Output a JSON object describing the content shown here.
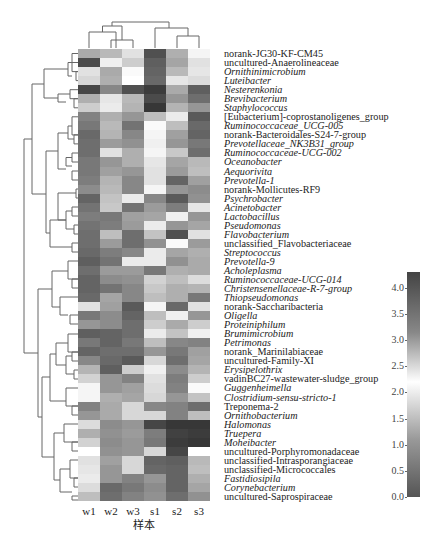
{
  "chart_data": {
    "type": "heatmap",
    "title": "",
    "xlabel": "样本",
    "ylabel": "",
    "columns": [
      "w1",
      "w2",
      "w3",
      "s1",
      "s2",
      "s3"
    ],
    "rows": [
      {
        "label": "norank-JG30-KF-CM45",
        "italic": false
      },
      {
        "label": "uncultured-Anaerolineaceae",
        "italic": false
      },
      {
        "label": "Ornithinimicrobium",
        "italic": true
      },
      {
        "label": "Luteibacter",
        "italic": true
      },
      {
        "label": "Nesterenkonia",
        "italic": true
      },
      {
        "label": "Brevibacterium",
        "italic": true
      },
      {
        "label": "Staphylococcus",
        "italic": true
      },
      {
        "label": "[Eubacterium]-coprostanoligenes_group",
        "italic": false
      },
      {
        "label": "Ruminococcaceae_UCG-005",
        "italic": true
      },
      {
        "label": "norank-Bacteroidales-S24-7-group",
        "italic": false
      },
      {
        "label": "Prevotellaceae_NK3B31_group",
        "italic": true
      },
      {
        "label": "Ruminococcaceae-UCG-002",
        "italic": true
      },
      {
        "label": "Oceanobacter",
        "italic": true
      },
      {
        "label": "Aequorivita",
        "italic": true
      },
      {
        "label": "Prevotella-1",
        "italic": true
      },
      {
        "label": "norank-Mollicutes-RF9",
        "italic": false
      },
      {
        "label": "Psychrobacter",
        "italic": true
      },
      {
        "label": "Acinetobacter",
        "italic": true
      },
      {
        "label": "Lactobacillus",
        "italic": true
      },
      {
        "label": "Pseudomonas",
        "italic": true
      },
      {
        "label": "Flavobacterium",
        "italic": true
      },
      {
        "label": "unclassified_Flavobacteriaceae",
        "italic": false
      },
      {
        "label": "Streptococcus",
        "italic": true
      },
      {
        "label": "Prevotella-9",
        "italic": true
      },
      {
        "label": "Acholeplasma",
        "italic": true
      },
      {
        "label": "Ruminococcaceae-UCG-014",
        "italic": true
      },
      {
        "label": "Christensenellaceae-R-7-group",
        "italic": true
      },
      {
        "label": "Thiopseudomonas",
        "italic": true
      },
      {
        "label": "norank-Saccharibacteria",
        "italic": false
      },
      {
        "label": "Oligella",
        "italic": true
      },
      {
        "label": "Proteiniphilum",
        "italic": true
      },
      {
        "label": "Brumimicrobium",
        "italic": true
      },
      {
        "label": "Petrimonas",
        "italic": true
      },
      {
        "label": "norank_Marinilabiaceae",
        "italic": false
      },
      {
        "label": "uncultured-Family-XI",
        "italic": false
      },
      {
        "label": "Erysipelothrix",
        "italic": true
      },
      {
        "label": "vadinBC27-wastewater-sludge_group",
        "italic": false
      },
      {
        "label": "Guggenheimella",
        "italic": true
      },
      {
        "label": "Clostridium-sensu-stricto-1",
        "italic": true
      },
      {
        "label": "Treponema-2",
        "italic": false
      },
      {
        "label": "Ornithobacterium",
        "italic": true
      },
      {
        "label": "Halomonas",
        "italic": true
      },
      {
        "label": "Truepera",
        "italic": true
      },
      {
        "label": "Moheibacter",
        "italic": true
      },
      {
        "label": "uncultured-Porphyromonadaceae",
        "italic": false
      },
      {
        "label": "unclassified-Intrasporangiaceae",
        "italic": false
      },
      {
        "label": "unclassified-Micrococcales",
        "italic": false
      },
      {
        "label": "Fastidiosipila",
        "italic": true
      },
      {
        "label": "Corynebacterium",
        "italic": true
      },
      {
        "label": "uncultured-Saprospiraceae",
        "italic": false
      }
    ],
    "cell_gray": [
      [
        170,
        185,
        225,
        80,
        175,
        245
      ],
      [
        75,
        240,
        205,
        95,
        165,
        225
      ],
      [
        225,
        170,
        250,
        100,
        185,
        230
      ],
      [
        215,
        175,
        255,
        105,
        230,
        220
      ],
      [
        70,
        135,
        80,
        60,
        170,
        95
      ],
      [
        175,
        230,
        185,
        75,
        150,
        110
      ],
      [
        205,
        235,
        180,
        55,
        180,
        150
      ],
      [
        130,
        175,
        150,
        190,
        235,
        90
      ],
      [
        120,
        185,
        115,
        250,
        190,
        105
      ],
      [
        105,
        180,
        135,
        245,
        160,
        100
      ],
      [
        110,
        155,
        145,
        240,
        150,
        120
      ],
      [
        110,
        225,
        175,
        245,
        200,
        110
      ],
      [
        120,
        150,
        175,
        230,
        165,
        185
      ],
      [
        120,
        160,
        150,
        225,
        155,
        190
      ],
      [
        125,
        180,
        135,
        225,
        100,
        160
      ],
      [
        140,
        185,
        135,
        245,
        150,
        140
      ],
      [
        100,
        195,
        235,
        135,
        90,
        145
      ],
      [
        115,
        200,
        115,
        155,
        125,
        230
      ],
      [
        125,
        120,
        160,
        165,
        240,
        150
      ],
      [
        115,
        125,
        155,
        235,
        150,
        165
      ],
      [
        110,
        190,
        110,
        195,
        80,
        225
      ],
      [
        110,
        155,
        110,
        145,
        250,
        155
      ],
      [
        105,
        125,
        135,
        235,
        165,
        175
      ],
      [
        95,
        115,
        235,
        235,
        145,
        170
      ],
      [
        110,
        155,
        155,
        120,
        175,
        170
      ],
      [
        100,
        140,
        145,
        210,
        190,
        220
      ],
      [
        100,
        115,
        135,
        200,
        175,
        180
      ],
      [
        105,
        165,
        135,
        190,
        175,
        120
      ],
      [
        225,
        160,
        90,
        245,
        105,
        225
      ],
      [
        120,
        140,
        100,
        190,
        240,
        150
      ],
      [
        150,
        140,
        110,
        205,
        170,
        205
      ],
      [
        95,
        100,
        110,
        235,
        195,
        240
      ],
      [
        120,
        100,
        120,
        190,
        135,
        130
      ],
      [
        100,
        110,
        110,
        150,
        120,
        160
      ],
      [
        135,
        105,
        90,
        215,
        110,
        165
      ],
      [
        180,
        95,
        205,
        240,
        140,
        180
      ],
      [
        210,
        150,
        130,
        225,
        125,
        205
      ],
      [
        245,
        150,
        160,
        220,
        130,
        250
      ],
      [
        245,
        175,
        165,
        215,
        150,
        195
      ],
      [
        130,
        170,
        215,
        135,
        130,
        110
      ],
      [
        150,
        170,
        215,
        215,
        130,
        190
      ],
      [
        220,
        140,
        150,
        70,
        55,
        55
      ],
      [
        175,
        145,
        155,
        125,
        65,
        60
      ],
      [
        210,
        140,
        150,
        120,
        60,
        55
      ],
      [
        255,
        145,
        150,
        215,
        70,
        255
      ],
      [
        225,
        160,
        215,
        100,
        95,
        185
      ],
      [
        230,
        150,
        215,
        105,
        100,
        190
      ],
      [
        235,
        150,
        130,
        150,
        100,
        175
      ],
      [
        220,
        105,
        120,
        140,
        100,
        165
      ],
      [
        190,
        110,
        130,
        145,
        110,
        145
      ]
    ],
    "colorbar": {
      "range": [
        0.0,
        4.3
      ],
      "ticks": [
        "4.0",
        "3.5",
        "3.0",
        "2.5",
        "2.0",
        "1.5",
        "1.0",
        "0.5",
        "0.0"
      ],
      "tick_values": [
        4.0,
        3.5,
        3.0,
        2.5,
        2.0,
        1.5,
        1.0,
        0.5,
        0.0
      ],
      "colors": {
        "low": "#555555",
        "mid": "#ffffff",
        "mid_value": 2.2,
        "high": "#444444"
      }
    },
    "dendrograms": {
      "row": true,
      "column": true
    },
    "legend_position": "right"
  }
}
